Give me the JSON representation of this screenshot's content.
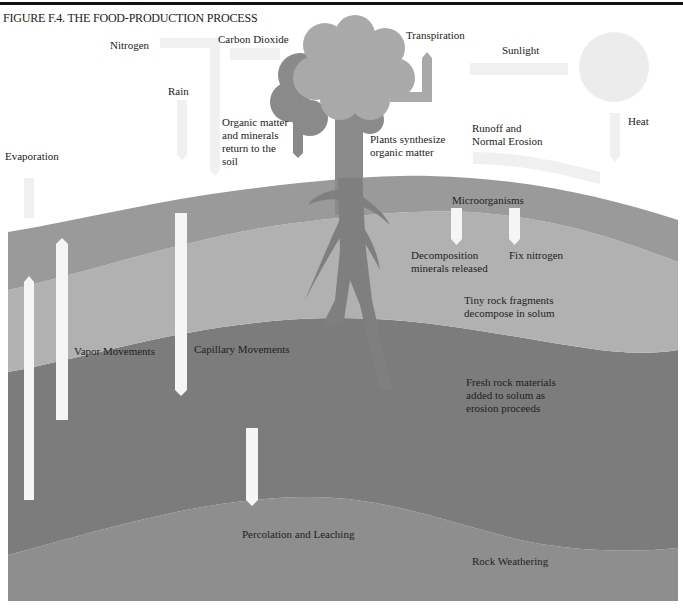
{
  "figure": {
    "title": "FIGURE F.4. THE FOOD-PRODUCTION PROCESS"
  },
  "colors": {
    "topsoil": "#9a9a9a",
    "subsoil": "#b1b1b1",
    "parent_material": "#7c7c7c",
    "bedrock": "#8e8e8e",
    "tree": "#8a8a8a",
    "canopy_light": "#a9a9a9",
    "arrows_faint": "#f0f0f0",
    "arrows_soil": "#f5f5f5",
    "sun": "#ececec"
  },
  "atmosphere_labels": {
    "nitrogen": "Nitrogen",
    "carbon_dioxide": "Carbon Dioxide",
    "transpiration": "Transpiration",
    "sunlight": "Sunlight",
    "rain": "Rain",
    "heat": "Heat",
    "evaporation": "Evaporation",
    "organic_return": [
      "Organic matter",
      "and minerals",
      "return to the",
      "soil"
    ],
    "plants_synthesize": [
      "Plants synthesize",
      "organic matter"
    ],
    "runoff": [
      "Runoff and",
      "Normal Erosion"
    ]
  },
  "soil_labels": {
    "microorganisms": "Microorganisms",
    "decomposition": [
      "Decomposition",
      "minerals released"
    ],
    "fix_nitrogen": "Fix nitrogen",
    "tiny_rock": [
      "Tiny rock fragments",
      "decompose in solum"
    ],
    "vapor": "Vapor Movements",
    "capillary": "Capillary Movements",
    "fresh_rock": [
      "Fresh rock materials",
      "added to solum as",
      "erosion proceeds"
    ],
    "percolation": "Percolation and Leaching",
    "rock_weathering": "Rock Weathering"
  }
}
